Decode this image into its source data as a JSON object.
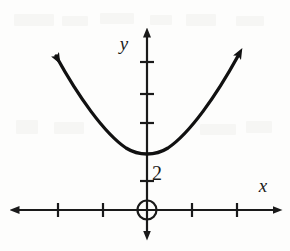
{
  "figure": {
    "kind": "cartesian-plane-parabola",
    "background_color": "#fdfdfc",
    "ink_color": "#1a1a1a"
  },
  "axes": {
    "x_label": "x",
    "y_label": "y",
    "origin_px": {
      "x": 147,
      "y": 210
    },
    "unit_px": {
      "x": 45,
      "y": 29.5
    },
    "x_axis": {
      "start_px": 10,
      "end_px": 282,
      "y_px": 210,
      "arrows": "both"
    },
    "y_axis": {
      "top_px": 28,
      "bottom_px": 240,
      "x_px": 147,
      "arrows": "both"
    },
    "x_ticks_px": [
      58,
      103,
      192,
      237
    ],
    "y_ticks_px": [
      62,
      94,
      123,
      181
    ],
    "origin_marker": "open-circle"
  },
  "curve": {
    "type": "parabola",
    "opens": "up",
    "vertex": {
      "x": 0,
      "y": 2
    },
    "vertex_px": {
      "x": 147,
      "y": 152
    },
    "endpoint_arrows": "both",
    "left_arrow_tip_px": {
      "x": 48,
      "y": 44
    },
    "right_arrow_tip_px": {
      "x": 245,
      "y": 44
    },
    "stroke_width": 3.2
  },
  "labels": {
    "y_intercept": "2",
    "y_intercept_px": {
      "x": 152,
      "y": 175
    },
    "x_axis_label_px": {
      "x": 263,
      "y": 192
    },
    "y_axis_label_px": {
      "x": 122,
      "y": 46
    }
  }
}
